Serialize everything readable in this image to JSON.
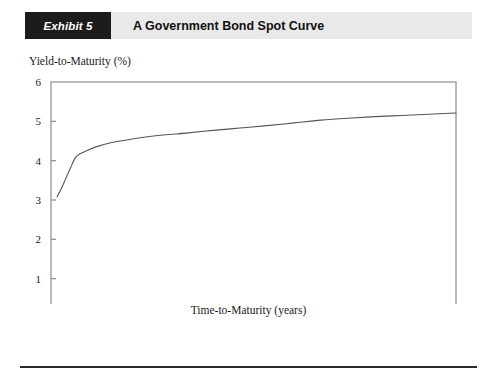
{
  "exhibit": {
    "tag": "Exhibit 5",
    "title": "A Government Bond Spot Curve"
  },
  "chart_data": {
    "type": "line",
    "title": "A Government Bond Spot Curve",
    "xlabel": "Time-to-Maturity (years)",
    "ylabel": "Yield-to-Maturity (%)",
    "xlim": [
      0,
      30
    ],
    "ylim": [
      0,
      6
    ],
    "xticks": [
      0,
      5,
      10,
      15,
      20,
      25,
      30
    ],
    "yticks": [
      0,
      1,
      2,
      3,
      4,
      5,
      6
    ],
    "xtick_labels": [
      "0",
      "5",
      "10",
      "15",
      "20",
      "25",
      "30"
    ],
    "ytick_labels": [
      "0",
      "1",
      "2",
      "3",
      "4",
      "5",
      "6"
    ],
    "grid": false,
    "legend": false,
    "series": [
      {
        "name": "Government bond spot curve",
        "color": "#555555",
        "x": [
          0.45,
          0.8,
          1.1,
          1.4,
          1.8,
          2.2,
          2.8,
          3.5,
          4.5,
          5.5,
          7.0,
          8.5,
          10.0,
          12.0,
          14.0,
          16.0,
          18.0,
          20.0,
          22.0,
          24.0,
          26.0,
          28.0,
          30.0
        ],
        "y": [
          3.08,
          3.32,
          3.55,
          3.78,
          4.07,
          4.18,
          4.28,
          4.37,
          4.46,
          4.52,
          4.6,
          4.66,
          4.7,
          4.77,
          4.83,
          4.89,
          4.96,
          5.03,
          5.08,
          5.12,
          5.15,
          5.18,
          5.21
        ]
      }
    ]
  }
}
